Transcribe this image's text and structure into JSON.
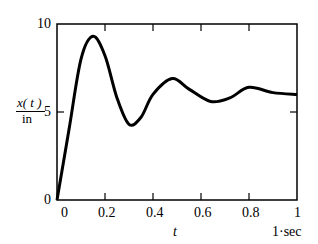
{
  "chart_data": {
    "type": "line",
    "title": "",
    "xlabel": "t",
    "xunit": "1·sec",
    "ylabel_num": "x( t )",
    "ylabel_den": "in",
    "xlim": [
      0,
      1
    ],
    "ylim": [
      0,
      10
    ],
    "xticks": [
      "0",
      "0.2",
      "0.4",
      "0.6",
      "0.8",
      "1"
    ],
    "yticks": [
      "0",
      "5",
      "10"
    ],
    "grid": false,
    "series": [
      {
        "name": "x(t)",
        "x": [
          0,
          0.05,
          0.1,
          0.15,
          0.2,
          0.25,
          0.3,
          0.35,
          0.4,
          0.48,
          0.55,
          0.64,
          0.72,
          0.8,
          0.9,
          1.0
        ],
        "y": [
          0,
          4.0,
          8.0,
          9.3,
          8.2,
          5.8,
          4.3,
          4.7,
          6.0,
          6.9,
          6.3,
          5.6,
          5.8,
          6.4,
          6.1,
          6.0
        ]
      }
    ]
  }
}
